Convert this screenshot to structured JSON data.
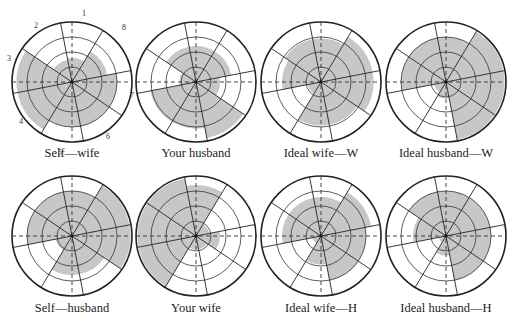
{
  "chart_data": {
    "type": "polar-area",
    "title": "",
    "rings": 4,
    "octant_labels": [
      "1",
      "2",
      "3",
      "4",
      "5",
      "6",
      "7",
      "8"
    ],
    "octant_order_note": "1 top, 2 upper-left, 3 left, 4 lower-left, 5 bottom, 6 lower-right, 7 right, 8 upper-right",
    "spoke_angles_deg": [
      11,
      59,
      101,
      146
    ],
    "panels": [
      {
        "name": "Self—wife",
        "values": {
          "1": 1.6,
          "2": 1.5,
          "3": 3.7,
          "4": 3.7,
          "5": 3.0,
          "6": 3.0,
          "7": 3.0,
          "8": 2.4
        },
        "show_octant_labels": true
      },
      {
        "name": "Your husband",
        "values": {
          "1": 2.4,
          "2": 2.4,
          "3": 1.1,
          "4": 3.1,
          "5": 3.1,
          "6": 3.8,
          "7": 1.6,
          "8": 2.4
        }
      },
      {
        "name": "Ideal wife—W",
        "values": {
          "1": 2.9,
          "2": 2.9,
          "3": 2.6,
          "4": 0.9,
          "5": 2.9,
          "6": 2.9,
          "7": 3.5,
          "8": 3.5
        }
      },
      {
        "name": "Ideal husband—W",
        "values": {
          "1": 3.0,
          "2": 3.0,
          "3": 3.0,
          "4": 0.8,
          "5": 1.1,
          "6": 3.9,
          "7": 3.9,
          "8": 3.9
        }
      },
      {
        "name": "Self—husband",
        "values": {
          "1": 3.0,
          "2": 3.0,
          "3": 3.0,
          "4": 1.1,
          "5": 2.6,
          "6": 2.6,
          "7": 3.9,
          "8": 3.9
        }
      },
      {
        "name": "Your wife",
        "values": {
          "1": 3.4,
          "2": 3.9,
          "3": 3.9,
          "4": 3.9,
          "5": 0.9,
          "6": 0.9,
          "7": 1.6,
          "8": 0.9
        }
      },
      {
        "name": "Ideal wife—H",
        "values": {
          "1": 2.6,
          "2": 2.6,
          "3": 2.6,
          "4": 0.6,
          "5": 1.9,
          "6": 3.0,
          "7": 3.0,
          "8": 3.4
        }
      },
      {
        "name": "Ideal husband—H",
        "values": {
          "1": 3.0,
          "2": 3.0,
          "3": 2.2,
          "4": 0.5,
          "5": 1.3,
          "6": 3.0,
          "7": 3.0,
          "8": 3.0
        }
      }
    ]
  },
  "layout": {
    "centers": [
      [
        72,
        82
      ],
      [
        196,
        82
      ],
      [
        321,
        82
      ],
      [
        446,
        82
      ],
      [
        72,
        236
      ],
      [
        196,
        236
      ],
      [
        321,
        236
      ],
      [
        446,
        236
      ]
    ],
    "radius": 60,
    "caption_y": [
      157,
      157,
      157,
      157,
      312,
      312,
      312,
      312
    ]
  },
  "captions": [
    "Self—wife",
    "Your husband",
    "Ideal wife—W",
    "Ideal husband—W",
    "Self—husband",
    "Your wife",
    "Ideal wife—H",
    "Ideal husband—H"
  ],
  "octant_label_positions": [
    {
      "label": "1",
      "x": 84,
      "y": 16
    },
    {
      "label": "2",
      "x": 36,
      "y": 28
    },
    {
      "label": "3",
      "x": 9,
      "y": 61
    },
    {
      "label": "4",
      "x": 21,
      "y": 124
    },
    {
      "label": "5",
      "x": 60,
      "y": 155
    },
    {
      "label": "6",
      "x": 108,
      "y": 139
    },
    {
      "label": "7",
      "x": 132,
      "y": 98
    },
    {
      "label": "8",
      "x": 124,
      "y": 30
    }
  ]
}
